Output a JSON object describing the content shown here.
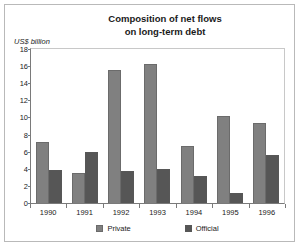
{
  "chart_data": {
    "type": "bar",
    "title": "Composition of net flows on long-term debt",
    "title_lines": [
      "Composition of net flows",
      "on long-term debt"
    ],
    "ylabel": "US$ billion",
    "xlabel": "",
    "categories": [
      "1990",
      "1991",
      "1992",
      "1993",
      "1994",
      "1995",
      "1996"
    ],
    "series": [
      {
        "name": "Private",
        "color": "#808080",
        "values": [
          7.1,
          3.5,
          15.5,
          16.2,
          6.7,
          10.2,
          9.4
        ]
      },
      {
        "name": "Official",
        "color": "#565656",
        "values": [
          3.9,
          6.0,
          3.8,
          4.0,
          3.2,
          1.2,
          5.6
        ]
      }
    ],
    "ylim": [
      0,
      18
    ],
    "yticks": [
      0,
      2,
      4,
      6,
      8,
      10,
      12,
      14,
      16,
      18
    ],
    "ytick_labels": [
      "0",
      "2",
      "4",
      "6",
      "8",
      "10",
      "12",
      "14",
      "16",
      "18"
    ],
    "grid": false,
    "legend_position": "bottom"
  }
}
